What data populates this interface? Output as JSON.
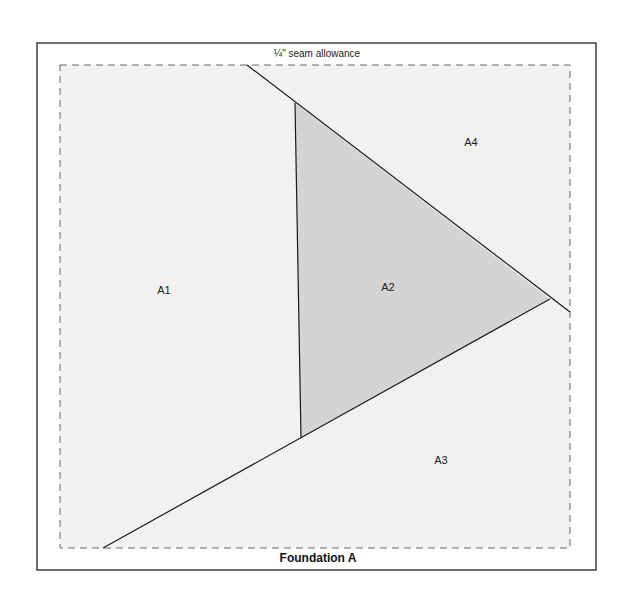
{
  "diagram": {
    "seam_label": "¼\" seam allowance",
    "title": "Foundation A",
    "colors": {
      "border": "#222222",
      "dashed": "#666666",
      "background_fill": "#f1f1f1",
      "triangle_fill": "#d4d4d4",
      "line": "#1a1a1a"
    },
    "sections": [
      {
        "id": "A1",
        "label": "A1"
      },
      {
        "id": "A2",
        "label": "A2"
      },
      {
        "id": "A3",
        "label": "A3"
      },
      {
        "id": "A4",
        "label": "A4"
      }
    ]
  }
}
